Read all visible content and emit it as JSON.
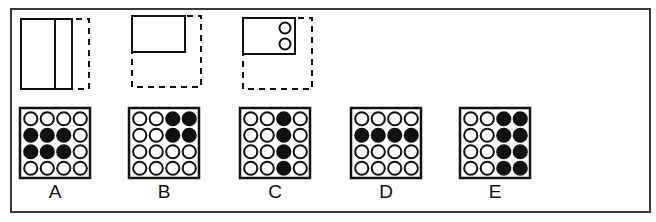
{
  "puzzle": {
    "top_label_fragment": "",
    "question_figures": [
      {
        "id": "fig-1",
        "description": "Rectangle divided by a vertical line with dashed outline extending to the right",
        "solid_rect": {
          "x": 21,
          "y": 19,
          "w": 51,
          "h": 70
        },
        "divider_x": 55,
        "dashed_rect": {
          "x": 21,
          "y": 19,
          "w": 68,
          "h": 70
        }
      },
      {
        "id": "fig-2",
        "description": "Small solid rectangle in the top-left of a dashed square",
        "solid_rect": {
          "x": 132,
          "y": 16,
          "w": 53,
          "h": 36
        },
        "dashed_rect": {
          "x": 132,
          "y": 16,
          "w": 69,
          "h": 71
        }
      },
      {
        "id": "fig-3",
        "description": "Small solid rectangle with two stacked circles in the top-left of a dashed square",
        "solid_rect": {
          "x": 243,
          "y": 18,
          "w": 52,
          "h": 36
        },
        "circles": [
          {
            "cx": 285,
            "cy": 28,
            "r": 5.5
          },
          {
            "cx": 285,
            "cy": 44,
            "r": 5.5
          }
        ],
        "dashed_rect": {
          "x": 243,
          "y": 18,
          "w": 69,
          "h": 71
        }
      }
    ],
    "answer_options": [
      {
        "label": "A",
        "x": 20,
        "grid": [
          [
            0,
            0,
            0,
            0
          ],
          [
            1,
            1,
            1,
            0
          ],
          [
            1,
            1,
            1,
            0
          ],
          [
            0,
            0,
            0,
            0
          ]
        ]
      },
      {
        "label": "B",
        "x": 129,
        "grid": [
          [
            0,
            0,
            1,
            1
          ],
          [
            0,
            0,
            1,
            1
          ],
          [
            0,
            0,
            0,
            0
          ],
          [
            0,
            0,
            0,
            0
          ]
        ]
      },
      {
        "label": "C",
        "x": 240,
        "grid": [
          [
            0,
            0,
            1,
            0
          ],
          [
            0,
            0,
            1,
            0
          ],
          [
            0,
            0,
            1,
            0
          ],
          [
            0,
            0,
            1,
            0
          ]
        ]
      },
      {
        "label": "D",
        "x": 351,
        "grid": [
          [
            0,
            0,
            0,
            0
          ],
          [
            1,
            1,
            1,
            1
          ],
          [
            0,
            0,
            0,
            0
          ],
          [
            0,
            0,
            0,
            0
          ]
        ]
      },
      {
        "label": "E",
        "x": 460,
        "grid": [
          [
            0,
            0,
            1,
            1
          ],
          [
            0,
            0,
            1,
            1
          ],
          [
            0,
            0,
            1,
            1
          ],
          [
            0,
            0,
            1,
            1
          ]
        ]
      }
    ],
    "colors": {
      "stroke": "#111111",
      "filled_circle": "#111111",
      "empty_circle_fill": "#ffffff",
      "frame": "#3a3a3a"
    }
  }
}
